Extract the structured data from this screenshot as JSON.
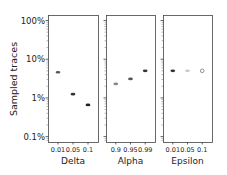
{
  "chart_data": {
    "type": "scatter",
    "ylabel": "Sampled traces",
    "yscale": "log",
    "ylim": [
      0.1,
      100
    ],
    "yticks": [
      "100%",
      "10%",
      "1%",
      "0.1%"
    ],
    "ytick_values": [
      100,
      10,
      1,
      0.1
    ],
    "grid": false,
    "panels": [
      {
        "xlabel": "Delta",
        "categories": [
          "0.01",
          "0.05",
          "0.1"
        ],
        "values": [
          4.6,
          1.25,
          0.66
        ],
        "marker_colors": [
          "#555555",
          "#333333",
          "#222222"
        ]
      },
      {
        "xlabel": "Alpha",
        "categories": [
          "0.9",
          "0.95",
          "0.99"
        ],
        "values": [
          2.3,
          3.1,
          5.0
        ],
        "marker_colors": [
          "#888888",
          "#555555",
          "#333333"
        ]
      },
      {
        "xlabel": "Epsilon",
        "categories": [
          "0.01",
          "0.05",
          "0.1"
        ],
        "values": [
          5.0,
          5.0,
          5.0
        ],
        "marker_colors": [
          "#333333",
          "#cccccc",
          "#777777"
        ]
      }
    ]
  }
}
